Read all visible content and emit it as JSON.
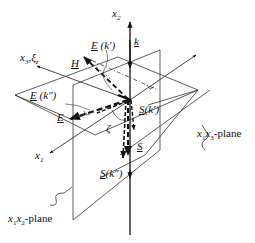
{
  "diagram": {
    "type": "3d-coordinate-diagram",
    "axes": {
      "x1": "x1",
      "x2": "x2",
      "x3": "x3, ξ3"
    },
    "vectors": {
      "k": "k",
      "H": "H",
      "E": "E",
      "E_k1": "E (k')",
      "E_k2": "E (k'')",
      "S": "S",
      "S_k1": "S (k')",
      "S_k2": "S (k'')"
    },
    "angle": "ζ",
    "planes": {
      "x1x2": "x1x2-plane",
      "x1x3": "x1x3-plane"
    }
  },
  "labels": {
    "x2": "x",
    "x2_sub": "2",
    "x3": "x",
    "x3_sub": "3",
    "xi": "ξ",
    "xi_sub": "z",
    "x1": "x",
    "x1_sub": "1",
    "k": "k",
    "H": "H",
    "E": "E",
    "E_k1_vec": "E",
    "E_k1_arg": "(k′)",
    "E_k2_vec": "E",
    "E_k2_arg": "(k″)",
    "S": "S",
    "S_k1_vec": "S",
    "S_k1_arg": "(k′)",
    "S_k2_vec": "S",
    "S_k2_arg": "(k″)",
    "zeta": "ζ",
    "plane_x1x3_a": "x",
    "plane_x1x3_s1": "1",
    "plane_x1x3_b": "x",
    "plane_x1x3_s3": "3",
    "plane_x1x3_suffix": "-plane",
    "plane_x1x2_a": "x",
    "plane_x1x2_s1": "1",
    "plane_x1x2_b": "x",
    "plane_x1x2_s2": "2",
    "plane_x1x2_suffix": "-plane"
  }
}
